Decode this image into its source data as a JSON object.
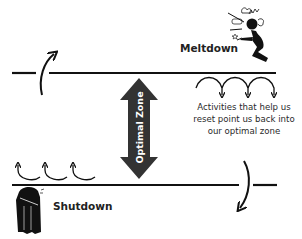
{
  "diagram": {
    "states": {
      "top": {
        "label": "Meltdown",
        "icon": "meltdown-person-icon"
      },
      "bottom": {
        "label": "Shutdown",
        "icon": "shutdown-person-icon"
      }
    },
    "zone": {
      "label": "Optimal Zone",
      "icon": "double-vertical-arrow-icon"
    },
    "reset_text": {
      "lines": [
        "Activities that help us",
        "reset point us back into",
        "our optimal zone"
      ]
    },
    "arrows": {
      "top_left_escape": "curved-arrow-up-icon",
      "bottom_right_escape": "curved-arrow-down-icon",
      "top_reset_count": 3,
      "bottom_reset_count": 3
    },
    "colors": {
      "line": "#111111",
      "zone_arrow": "#333333",
      "text": "#222222",
      "background": "#ffffff"
    }
  }
}
